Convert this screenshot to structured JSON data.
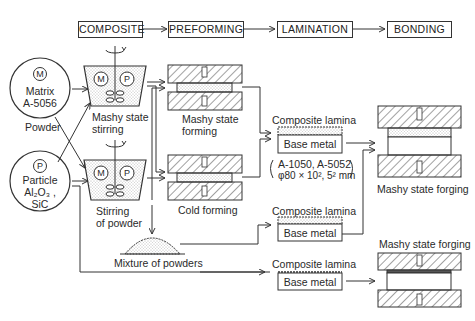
{
  "stages": [
    "COMPOSITE",
    "PREFORMING",
    "LAMINATION",
    "BONDING"
  ],
  "inputs": {
    "matrix": {
      "symbol": "M",
      "name": "Matrix",
      "alloy": "A-5056",
      "form": "Powder"
    },
    "particle": {
      "symbol": "P",
      "name": "Particle",
      "materials_line1": "Al₂O₃ ,",
      "materials_line2": "SiC"
    }
  },
  "composite": {
    "mashy_stirring": {
      "line1": "Mashy state",
      "line2": "stirring",
      "symbols": [
        "M",
        "P"
      ]
    },
    "powder_stirring": {
      "line1": "Stirring",
      "line2": "of powder",
      "symbols": [
        "M",
        "P"
      ]
    },
    "mixture": "Mixture of powders"
  },
  "preforming": {
    "mashy_forming": {
      "line1": "Mashy state",
      "line2": "forming"
    },
    "cold_forming": "Cold forming"
  },
  "lamination": {
    "lamina1": {
      "top": "Composite lamina",
      "base": "Base metal"
    },
    "spec": {
      "line1": "A-1050, A-5052",
      "line2": "φ80 × 10², 5² mm"
    },
    "lamina2": {
      "top": "Composite lamina",
      "base": "Base metal"
    },
    "lamina3": {
      "top": "Composite lamina",
      "base": "Base metal"
    }
  },
  "bonding": {
    "forging1": "Mashy state forging",
    "forging2": "Mashy state forging"
  }
}
